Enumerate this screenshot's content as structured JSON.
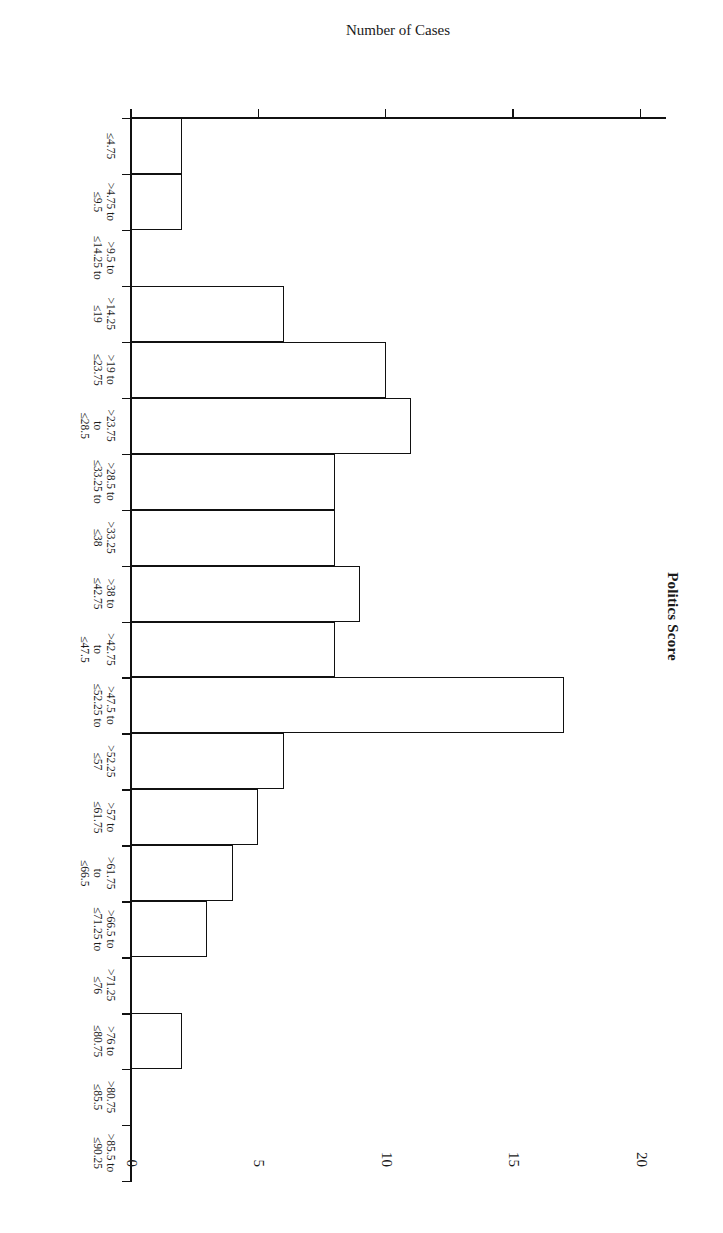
{
  "figure": {
    "title": "Politics Score",
    "value_axis_title": "Number of Cases",
    "value_ticks": [
      "0",
      "5",
      "10",
      "15",
      "20"
    ],
    "axis_color": "#111111",
    "bar_fill": "#ffffff",
    "bar_stroke": "#111111",
    "rotation_degrees": 90
  },
  "chart_data": {
    "type": "bar",
    "title": "Politics Score",
    "xlabel": "Politics Score",
    "ylabel": "Number of Cases",
    "ylim": [
      0,
      21
    ],
    "ytick_values": [
      0,
      5,
      10,
      15,
      20
    ],
    "grid": false,
    "legend": "none",
    "orientation": "rotated-90-clockwise",
    "bin_width": 4.75,
    "categories": [
      "≤4.75",
      ">4.75 to ≤9.5",
      ">9.5 to ≤14.25",
      ">14.25 to ≤19",
      ">19 to ≤23.75",
      ">23.75 to ≤28.5",
      ">28.5 to ≤33.25",
      ">33.25 to ≤38",
      ">38 to ≤42.75",
      ">42.75 to ≤47.5",
      ">47.5 to ≤52.25",
      ">52.25 to ≤57",
      ">57 to ≤61.75",
      ">61.75 to ≤66.5",
      ">66.5 to ≤71.25",
      ">71.25 to ≤76",
      ">76 to ≤80.75",
      ">80.75 to ≤85.5",
      ">85.5 to ≤90.25"
    ],
    "values": [
      2,
      2,
      0,
      6,
      10,
      11,
      8,
      8,
      9,
      8,
      17,
      6,
      5,
      4,
      3,
      0,
      2,
      0,
      0
    ],
    "category_labels_rendered": [
      "≤4.75",
      ">4.75 to\n≤9.5",
      ">9.5 to\n≤14.25 to",
      ">14.25\n≤19",
      ">19 to\n≤23.75",
      ">23.75\nto\n≤28.5",
      ">28.5 to\n≤33.25 to",
      ">33.25\n≤38",
      ">38 to\n≤42.75",
      ">42.75\nto\n≤47.5",
      ">47.5 to\n≤52.25 to",
      ">52.25\n≤57",
      ">57 to\n≤61.75",
      ">61.75\nto\n≤66.5",
      ">66.5 to\n≤71.25 to",
      ">71.25\n≤76",
      ">76 to\n≤80.75",
      ">80.75\n≤85.5",
      ">85.5 to\n≤90.25"
    ]
  }
}
